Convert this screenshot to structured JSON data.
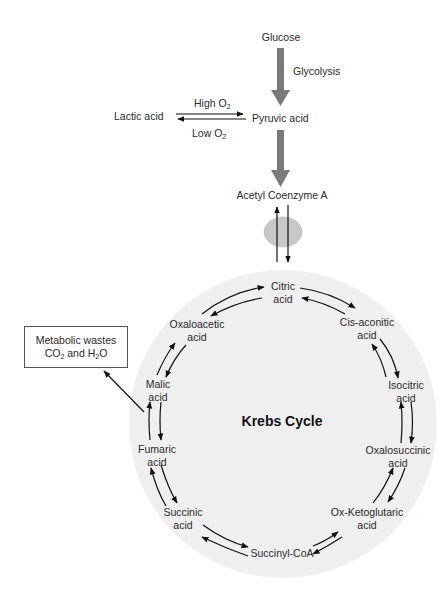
{
  "diagram": {
    "top_pathway": {
      "glucose": "Glucose",
      "glycolysis": "Glycolysis",
      "pyruvic_acid": "Pyruvic acid",
      "lactic_acid": "Lactic acid",
      "high_o2": {
        "text": "High O",
        "sub": "2"
      },
      "low_o2": {
        "text": "Low O",
        "sub": "2"
      },
      "acetyl_coa": "Acetyl Coenzyme A"
    },
    "wastes_box": {
      "line1": "Metabolic wastes",
      "line2": {
        "a": "CO",
        "a_sub": "2",
        "b": " and H",
        "b_sub": "2",
        "c": "O"
      }
    },
    "cycle": {
      "title": "Krebs Cycle",
      "nodes": [
        {
          "name": "Citric",
          "line2": "acid"
        },
        {
          "name": "Cis-aconitic",
          "line2": "acid"
        },
        {
          "name": "Isocitric",
          "line2": "acid"
        },
        {
          "name": "Oxalosuccinic",
          "line2": "acid"
        },
        {
          "name": "Ox-Ketoglutaric",
          "line2": "acid"
        },
        {
          "name": "Succinyl-CoA",
          "line2": ""
        },
        {
          "name": "Succinic",
          "line2": "acid"
        },
        {
          "name": "Fumaric",
          "line2": "acid"
        },
        {
          "name": "Malic",
          "line2": "acid"
        },
        {
          "name": "Oxaloacetic",
          "line2": "acid"
        }
      ]
    },
    "colors": {
      "thick_arrow": "#7a7a7a",
      "cycle_fill": "#efefef",
      "membrane_ellipse": "#c8c8c8",
      "line": "#111111"
    }
  }
}
